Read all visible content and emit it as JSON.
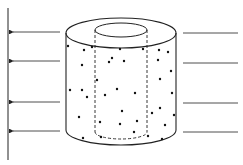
{
  "diagram": {
    "colors": {
      "stroke": "#222222",
      "background": "#ffffff",
      "dot": "#111111"
    },
    "left_boundary": {
      "x": 8,
      "y1": 8,
      "y2": 160
    },
    "left_arrows": [
      {
        "y": 32,
        "x_start": 60,
        "x_end": 10
      },
      {
        "y": 61,
        "x_start": 60,
        "x_end": 10
      },
      {
        "y": 102,
        "x_start": 60,
        "x_end": 10
      },
      {
        "y": 131,
        "x_start": 60,
        "x_end": 10
      }
    ],
    "right_lines": [
      {
        "y": 33,
        "x_start": 183,
        "x_end": 238
      },
      {
        "y": 63,
        "x_start": 183,
        "x_end": 238
      },
      {
        "y": 103,
        "x_start": 183,
        "x_end": 238
      },
      {
        "y": 132,
        "x_start": 183,
        "x_end": 238
      }
    ],
    "outer_cylinder": {
      "cx": 121,
      "top_cy": 33,
      "bottom_cy": 130,
      "rx": 55,
      "ry": 15
    },
    "inner_cylinder": {
      "cx": 121,
      "top_cy": 30,
      "bottom_cy": 132,
      "rx": 26,
      "ry": 7
    },
    "particles": [
      [
        68,
        46
      ],
      [
        84,
        50
      ],
      [
        92,
        47
      ],
      [
        120,
        49
      ],
      [
        143,
        49
      ],
      [
        159,
        50
      ],
      [
        168,
        52
      ],
      [
        112,
        58
      ],
      [
        109,
        62
      ],
      [
        124,
        61
      ],
      [
        158,
        60
      ],
      [
        82,
        65
      ],
      [
        171,
        71
      ],
      [
        97,
        80
      ],
      [
        160,
        79
      ],
      [
        70,
        90
      ],
      [
        82,
        90
      ],
      [
        87,
        97
      ],
      [
        105,
        95
      ],
      [
        117,
        89
      ],
      [
        135,
        93
      ],
      [
        172,
        93
      ],
      [
        122,
        111
      ],
      [
        152,
        113
      ],
      [
        160,
        108
      ],
      [
        79,
        117
      ],
      [
        100,
        122
      ],
      [
        137,
        121
      ],
      [
        174,
        115
      ],
      [
        120,
        124
      ],
      [
        134,
        132
      ],
      [
        165,
        125
      ],
      [
        83,
        138
      ],
      [
        101,
        137
      ],
      [
        148,
        136
      ],
      [
        162,
        139
      ]
    ]
  }
}
